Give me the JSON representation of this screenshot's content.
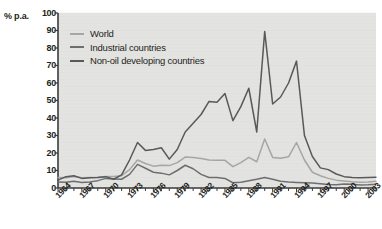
{
  "chart_data": {
    "type": "line",
    "title": "",
    "xlabel": "",
    "ylabel": "% p.a.",
    "ylim": [
      0,
      100
    ],
    "ytick_step": 10,
    "yticks": [
      "0",
      "10",
      "20",
      "30",
      "40",
      "50",
      "60",
      "70",
      "80",
      "90",
      "100"
    ],
    "xlim": [
      1964,
      2004
    ],
    "xticks": [
      "1964",
      "1967",
      "1970",
      "1973",
      "1976",
      "1979",
      "1982",
      "1985",
      "1988",
      "1991",
      "1994",
      "1997",
      "2000",
      "2003"
    ],
    "xtick_step": 3,
    "grid": false,
    "legend_position": "top-left",
    "plot_background": "#e3e3e1",
    "x": [
      1964,
      1965,
      1966,
      1967,
      1968,
      1969,
      1970,
      1971,
      1972,
      1973,
      1974,
      1975,
      1976,
      1977,
      1978,
      1979,
      1980,
      1981,
      1982,
      1983,
      1984,
      1985,
      1986,
      1987,
      1988,
      1989,
      1990,
      1991,
      1992,
      1993,
      1994,
      1995,
      1996,
      1997,
      1998,
      1999,
      2000,
      2001,
      2002,
      2003,
      2004
    ],
    "series": [
      {
        "name": "World",
        "color": "#a6a6a4",
        "values": [
          6.0,
          5.8,
          6.6,
          5.8,
          6.0,
          6.2,
          6.6,
          6.6,
          7.0,
          10.5,
          16.0,
          14.0,
          12.5,
          13.0,
          12.8,
          14.5,
          17.7,
          17.4,
          16.8,
          16.0,
          15.8,
          15.8,
          12.2,
          14.5,
          17.5,
          15.0,
          28.0,
          17.5,
          17.0,
          17.8,
          26.0,
          16.0,
          9.0,
          7.0,
          5.5,
          4.5,
          4.0,
          3.6,
          3.3,
          3.5,
          3.8
        ]
      },
      {
        "name": "Industrial countries",
        "color": "#6d6e70",
        "values": [
          3.5,
          3.3,
          3.8,
          3.2,
          3.5,
          4.2,
          5.5,
          5.2,
          5.0,
          7.8,
          13.5,
          11.3,
          9.0,
          8.5,
          7.5,
          10.0,
          13.0,
          11.0,
          7.8,
          6.0,
          6.0,
          5.5,
          3.0,
          3.3,
          4.2,
          5.0,
          6.0,
          5.0,
          3.9,
          3.5,
          3.2,
          3.0,
          2.8,
          2.5,
          2.0,
          1.8,
          2.3,
          2.2,
          1.7,
          1.9,
          2.2
        ]
      },
      {
        "name": "Non-oil developing countries",
        "color": "#58595b",
        "values": [
          4.5,
          6.5,
          7.0,
          5.5,
          5.8,
          6.0,
          6.5,
          5.0,
          7.5,
          16.0,
          26.0,
          21.5,
          22.0,
          23.0,
          16.5,
          22.0,
          32.0,
          37.0,
          42.0,
          49.5,
          49.0,
          54.0,
          38.5,
          46.5,
          57.0,
          32.0,
          89.5,
          48.0,
          52.0,
          60.0,
          72.5,
          30.0,
          18.0,
          11.5,
          10.5,
          8.0,
          6.5,
          6.0,
          5.8,
          6.0,
          6.2
        ]
      }
    ]
  }
}
